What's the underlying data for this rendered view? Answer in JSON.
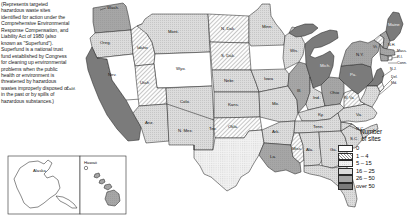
{
  "caption": {
    "text": "(Represents targeted hazardous waste sites identified for action under the Comprehensive Environmental Response Compensation, and Liability Act of 1980 (also known as \"Superfund\"). Superfund is a national trust fund established by Congress for cleaning up environmental problems when the public health or environment is threatened by hazardous wastes improperly disposed of in the past or by spills of hazardous substances.)"
  },
  "legend": {
    "title_line1": "Number",
    "title_line2": "of sites",
    "classes": [
      {
        "label": "0",
        "pattern": "solid",
        "color": "#ffffff"
      },
      {
        "label": "1 – 4",
        "pattern": "hatch-diagonal",
        "color": "#e8e8e8"
      },
      {
        "label": "5 – 15",
        "pattern": "dots-fine",
        "color": "#dedede"
      },
      {
        "label": "16 – 25",
        "pattern": "hatch-light",
        "color": "#c9c9c9"
      },
      {
        "label": "26 – 50",
        "pattern": "hatch-medium",
        "color": "#a8a8a8"
      },
      {
        "label": "over 50",
        "pattern": "solid-dark",
        "color": "#7b7b7b"
      }
    ]
  },
  "insets": [
    {
      "name": "alaska",
      "label": "Alaska",
      "class_index": 0
    },
    {
      "name": "hawaii",
      "label": "Hawaii",
      "class_index": 4
    }
  ],
  "states": [
    {
      "abbr": "Wash.",
      "label": "Wash.",
      "class_index": 4
    },
    {
      "abbr": "Oreg.",
      "label": "Oreg.",
      "class_index": 3
    },
    {
      "abbr": "Calif.",
      "label": "Calif.",
      "class_index": 5
    },
    {
      "abbr": "Nev.",
      "label": "Nev.",
      "class_index": 0
    },
    {
      "abbr": "Idaho",
      "label": "Idaho",
      "class_index": 1
    },
    {
      "abbr": "Mont.",
      "label": "Mont.",
      "class_index": 3
    },
    {
      "abbr": "Wyo.",
      "label": "Wyo.",
      "class_index": 0
    },
    {
      "abbr": "Utah",
      "label": "Utah",
      "class_index": 1
    },
    {
      "abbr": "Colo.",
      "label": "Colo.",
      "class_index": 3
    },
    {
      "abbr": "Ariz.",
      "label": "Ariz.",
      "class_index": 3
    },
    {
      "abbr": "N. Mex.",
      "label": "N. Mex.",
      "class_index": 3
    },
    {
      "abbr": "N. Dak.",
      "label": "N. Dak.",
      "class_index": 1
    },
    {
      "abbr": "S. Dak.",
      "label": "S. Dak.",
      "class_index": 1
    },
    {
      "abbr": "Nebr.",
      "label": "Nebr.",
      "class_index": 3
    },
    {
      "abbr": "Kans.",
      "label": "Kans.",
      "class_index": 3
    },
    {
      "abbr": "Okla.",
      "label": "Okla.",
      "class_index": 1
    },
    {
      "abbr": "Tex.",
      "label": "Tex.",
      "class_index": 2
    },
    {
      "abbr": "Minn.",
      "label": "Minn.",
      "class_index": 3
    },
    {
      "abbr": "Iowa",
      "label": "Iowa",
      "class_index": 3
    },
    {
      "abbr": "Mo.",
      "label": "Mo.",
      "class_index": 3
    },
    {
      "abbr": "Ark.",
      "label": "Ark.",
      "class_index": 3
    },
    {
      "abbr": "La.",
      "label": "La.",
      "class_index": 4
    },
    {
      "abbr": "Wis.",
      "label": "Wis.",
      "class_index": 3
    },
    {
      "abbr": "Ill.",
      "label": "Ill.",
      "class_index": 4
    },
    {
      "abbr": "Mich.",
      "label": "Mich.",
      "class_index": 5
    },
    {
      "abbr": "Ind.",
      "label": "Ind.",
      "class_index": 3
    },
    {
      "abbr": "Ohio",
      "label": "Ohio",
      "class_index": 4
    },
    {
      "abbr": "Ky.",
      "label": "Ky.",
      "class_index": 3
    },
    {
      "abbr": "Tenn.",
      "label": "Tenn.",
      "class_index": 3
    },
    {
      "abbr": "Miss.",
      "label": "Miss.",
      "class_index": 1
    },
    {
      "abbr": "Ala.",
      "label": "Ala.",
      "class_index": 3
    },
    {
      "abbr": "Ga.",
      "label": "Ga.",
      "class_index": 3
    },
    {
      "abbr": "Fla.",
      "label": "Fla.",
      "class_index": 3
    },
    {
      "abbr": "S.C.",
      "label": "S.C.",
      "class_index": 3
    },
    {
      "abbr": "N.C.",
      "label": "N.C.",
      "class_index": 3
    },
    {
      "abbr": "Va.",
      "label": "Va.",
      "class_index": 3
    },
    {
      "abbr": "W. Va.",
      "label": "W. Va.",
      "class_index": 1
    },
    {
      "abbr": "Pa.",
      "label": "Pa.",
      "class_index": 5
    },
    {
      "abbr": "N.Y.",
      "label": "N.Y.",
      "class_index": 4
    },
    {
      "abbr": "Vt.",
      "label": "Vt.",
      "class_index": 1
    },
    {
      "abbr": "N.H.",
      "label": "N.H.",
      "class_index": 4
    },
    {
      "abbr": "Maine",
      "label": "Maine",
      "class_index": 5
    },
    {
      "abbr": "Mass.",
      "label": "Mass.",
      "class_index": 4
    },
    {
      "abbr": "R.I.",
      "label": "R.I.",
      "class_index": 1
    },
    {
      "abbr": "Conn.",
      "label": "Conn.",
      "class_index": 4
    },
    {
      "abbr": "N.J.",
      "label": "N.J.",
      "class_index": 5
    },
    {
      "abbr": "Del.",
      "label": "Del.",
      "class_index": 1
    },
    {
      "abbr": "Md.",
      "label": "Md.",
      "class_index": 3
    }
  ]
}
